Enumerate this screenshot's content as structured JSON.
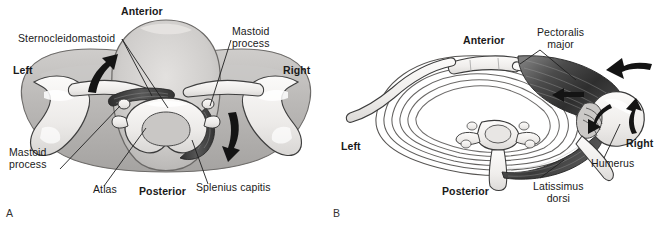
{
  "figure": {
    "panels": [
      {
        "letter": "A",
        "view": "Transverse section through head and neck at the level of the atlas",
        "orientation": {
          "anterior": "Anterior",
          "posterior": "Posterior",
          "left": "Left",
          "right": "Right"
        },
        "labels": [
          {
            "name": "sternocleidomastoid",
            "text": "Sternocleidomastoid"
          },
          {
            "name": "mastoid-process-right",
            "text": "Mastoid\nprocess"
          },
          {
            "name": "mastoid-process-left",
            "text": "Mastoid\nprocess"
          },
          {
            "name": "atlas",
            "text": "Atlas"
          },
          {
            "name": "splenius-capitis",
            "text": "Splenius capitis"
          }
        ],
        "arrows": [
          {
            "name": "rotation-arrow-left",
            "direction": "up-right"
          },
          {
            "name": "rotation-arrow-right",
            "direction": "down-right"
          }
        ]
      },
      {
        "letter": "B",
        "view": "Transverse section through thorax at the level of the shoulders",
        "orientation": {
          "anterior": "Anterior",
          "posterior": "Posterior",
          "left": "Left",
          "right": "Right"
        },
        "labels": [
          {
            "name": "pectoralis-major",
            "text": "Pectoralis\nmajor"
          },
          {
            "name": "humerus",
            "text": "Humerus"
          },
          {
            "name": "latissimus-dorsi",
            "text": "Latissimus\ndorsi"
          }
        ],
        "arrows": [
          {
            "name": "pectoralis-pull-arrow",
            "direction": "left"
          },
          {
            "name": "trunk-rotation-arrow",
            "direction": "left"
          },
          {
            "name": "humerus-rotation-arrow-upper",
            "direction": "left-down"
          },
          {
            "name": "humerus-rotation-arrow-lower",
            "direction": "up"
          }
        ]
      }
    ]
  },
  "colors": {
    "ink": "#1a1a1a",
    "leader": "#222222",
    "bone_fill": "#f2f0ee",
    "bone_outline": "#3b3b3b",
    "soft_tissue_light": "#d9d7d5",
    "soft_tissue_mid": "#bcbab8",
    "soft_tissue_dark": "#9a9896",
    "muscle_dark": "#4a4a4a",
    "muscle_mid": "#6e6e6e",
    "arrow": "#171717",
    "background": "#ffffff"
  }
}
